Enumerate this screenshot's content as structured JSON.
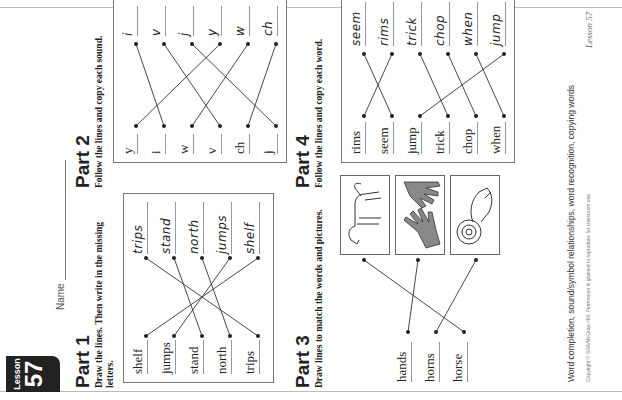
{
  "header": {
    "lesson_label": "Lesson",
    "lesson_number": "57",
    "name_label": "Name"
  },
  "part1": {
    "title": "Part 1",
    "instructions": "Draw the lines. Then write in the missing letters.",
    "left_words": [
      "shelf",
      "jumps",
      "stand",
      "north",
      "trips"
    ],
    "right_words": [
      "trips",
      "stand",
      "north",
      "jumps",
      "shelf"
    ]
  },
  "part2": {
    "title": "Part 2",
    "instructions": "Follow the lines and copy each sound.",
    "left_sounds": [
      "y",
      "i",
      "w",
      "v",
      "ch",
      "j"
    ],
    "right_sounds": [
      "i",
      "v",
      "j",
      "y",
      "w",
      "ch"
    ]
  },
  "part3": {
    "title": "Part 3",
    "instructions": "Draw lines to match the words and pictures.",
    "words": [
      "hands",
      "horns",
      "horse"
    ],
    "pictures": [
      "horse-picture",
      "hands-picture",
      "ram-horns-picture"
    ]
  },
  "part4": {
    "title": "Part 4",
    "instructions": "Follow the lines and copy each word.",
    "left_words": [
      "rims",
      "seem",
      "jump",
      "trick",
      "chop",
      "when"
    ],
    "right_words": [
      "seem",
      "rims",
      "trick",
      "chop",
      "when",
      "jump"
    ]
  },
  "footer": {
    "skills": "Word completion, sound/symbol relationships, word recognition, copying words",
    "copyright": "Copyright © SRA/McGraw-Hill. Permission is granted to reproduce for classroom use.",
    "lesson_ref": "Lesson 57"
  },
  "colors": {
    "badge_bg": "#222222",
    "line": "#333333",
    "border": "#777777"
  }
}
